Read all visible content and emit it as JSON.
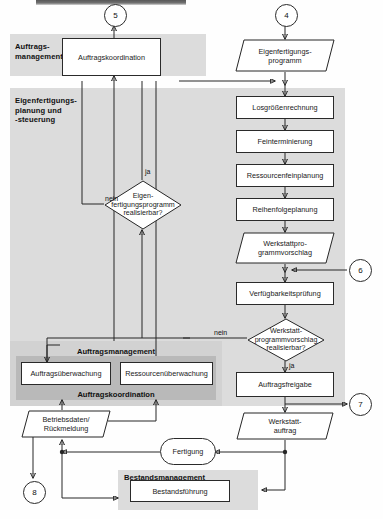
{
  "diagram": {
    "language": "de"
  },
  "bands": [
    {
      "id": "auftragsmanagement-top",
      "label": "Auftrags-\nmanagement",
      "shade": "#dcdcdc"
    },
    {
      "id": "eigenfertigungsplanung",
      "label": "Eigenfertigungs-\nplanung und\n-steuerung",
      "shade": "#dcdcdc"
    },
    {
      "id": "auftragsmanagement-bottom",
      "label": "Auftragsmanagement",
      "shade": "#d2d2d2"
    },
    {
      "id": "auftragskoordination",
      "label": "Auftragskoordination",
      "shade": "#b9b9b9"
    },
    {
      "id": "bestandsmanagement",
      "label": "Bestandsmanagement",
      "shade": "#dcdcdc"
    }
  ],
  "nodes": {
    "auftragskoordination_box": {
      "label": "Auftragskoordination",
      "shape": "process"
    },
    "eigenfertigungsprogramm": {
      "label": "Eigenfertigungs-\nprogramm",
      "shape": "data"
    },
    "losgroessenrechnung": {
      "label": "Losgrößenrechnung",
      "shape": "process"
    },
    "feinterminierung": {
      "label": "Feinterminierung",
      "shape": "process"
    },
    "ressourcenfeinplanung": {
      "label": "Ressourcenfeinplanung",
      "shape": "process"
    },
    "reihenfolgeplanung": {
      "label": "Reihenfolgeplanung",
      "shape": "process"
    },
    "werkstattprogrammvorschlag": {
      "label": "Werkstattpro-\ngrammvorschlag",
      "shape": "data"
    },
    "verfuegbarkeitspruefung": {
      "label": "Verfügbarkeitsprüfung",
      "shape": "process"
    },
    "decision_eigen": {
      "label": "Eigen-\nfertigungsprogramm\nrealisierbar?",
      "shape": "decision"
    },
    "decision_werkstatt": {
      "label": "Werkstatt-\nprogrammvorschlag\nrealisierbar?",
      "shape": "decision"
    },
    "auftragsfreigabe": {
      "label": "Auftragsfreigabe",
      "shape": "process"
    },
    "werkstattauftrag": {
      "label": "Werkstatt-\nauftrag",
      "shape": "data"
    },
    "auftragsueberwachung": {
      "label": "Auftragsüberwachung",
      "shape": "process"
    },
    "ressourcenueberwachung": {
      "label": "Ressourcenüberwachung",
      "shape": "process"
    },
    "betriebsdaten": {
      "label": "Betriebsdaten/\nRückmeldung",
      "shape": "data"
    },
    "fertigung": {
      "label": "Fertigung",
      "shape": "stadium"
    },
    "bestandsfuehrung": {
      "label": "Bestandsführung",
      "shape": "process"
    }
  },
  "connectors": [
    {
      "id": "connector-5",
      "label": "5",
      "position": "top-left"
    },
    {
      "id": "connector-4",
      "label": "4",
      "position": "top-right"
    },
    {
      "id": "connector-6",
      "label": "6",
      "position": "right-middle"
    },
    {
      "id": "connector-7",
      "label": "7",
      "position": "right-lower"
    },
    {
      "id": "connector-8",
      "label": "8",
      "position": "bottom-left"
    }
  ],
  "edge_labels": {
    "eigen_ja": "ja",
    "eigen_nein": "nein",
    "werkstatt_nein": "nein",
    "werkstatt_ja": "ja"
  },
  "colors": {
    "band_light": "#dcdcdc",
    "band_mid": "#d2d2d2",
    "band_dark": "#b9b9b9",
    "node_fill": "#ffffff",
    "stroke": "#262626",
    "text": "#1a1a1a"
  }
}
